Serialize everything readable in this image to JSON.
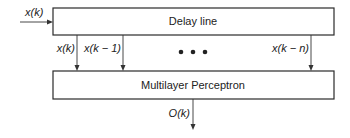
{
  "diagram": {
    "input_label": "x(k)",
    "delay_line": {
      "label": "Delay line"
    },
    "taps": [
      {
        "label": "x(k)"
      },
      {
        "label": "x(k − 1)"
      },
      {
        "label": "x(k − n)"
      }
    ],
    "ellipsis": "• • •",
    "mlp": {
      "label": "Multilayer Perceptron"
    },
    "output_label": "O(k)"
  }
}
